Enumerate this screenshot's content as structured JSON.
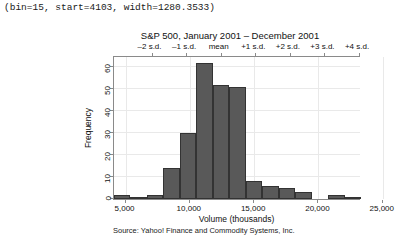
{
  "header": {
    "params_text": "(bin=15, start=4103, width=1280.3533)"
  },
  "source": {
    "text": "Source: Yahoo! Finance and Commodity Systems, Inc."
  },
  "chart_data": {
    "type": "bar",
    "title": "S&P 500, January 2001 – December 2001",
    "xlabel": "Volume (thousands)",
    "ylabel": "Frequency",
    "xlim": [
      4103,
      23308
    ],
    "ylim": [
      0,
      65
    ],
    "grid": true,
    "legend_position": "none",
    "bin_width": 1280.3533,
    "bin_start": 4103,
    "bin_count": 15,
    "categories": [
      "4103–5383",
      "5383–6664",
      "6664–7944",
      "7944–9225",
      "9225–10505",
      "10505–11786",
      "11786–13066",
      "13066–14346",
      "14346–15627",
      "15627–16907",
      "16907–18188",
      "18188–19468",
      "19468–20748",
      "20748–22029",
      "22029–23309"
    ],
    "values": [
      2,
      1,
      2,
      14,
      30,
      62,
      52,
      51,
      8,
      6,
      5,
      3,
      0,
      2,
      1
    ],
    "x_ticks": [
      {
        "value": 5000,
        "label": "5,000"
      },
      {
        "value": 10000,
        "label": "10,000"
      },
      {
        "value": 15000,
        "label": "15,000"
      },
      {
        "value": 20000,
        "label": "20,000"
      },
      {
        "value": 25000,
        "label": "25,000"
      }
    ],
    "y_ticks": [
      {
        "value": 0,
        "label": "0"
      },
      {
        "value": 10,
        "label": "10"
      },
      {
        "value": 20,
        "label": "20"
      },
      {
        "value": 30,
        "label": "30"
      },
      {
        "value": 40,
        "label": "40"
      },
      {
        "value": 50,
        "label": "50"
      },
      {
        "value": 60,
        "label": "60"
      }
    ],
    "top_axis_label": "standard deviation scale",
    "sd_ticks": [
      {
        "label": "–2 s.d.",
        "pos": 0.152
      },
      {
        "label": "–1 s.d.",
        "pos": 0.292
      },
      {
        "label": "mean",
        "pos": 0.432
      },
      {
        "label": "+1 s.d.",
        "pos": 0.572
      },
      {
        "label": "+2 s.d.",
        "pos": 0.712
      },
      {
        "label": "+3 s.d.",
        "pos": 0.852
      },
      {
        "label": "+4 s.d.",
        "pos": 0.992
      }
    ],
    "colors": {
      "bar_fill": "#595959",
      "bar_border": "#333333",
      "axis": "#8a8a8a",
      "grid": "#e9e9e9",
      "text": "#111111",
      "background": "#ffffff"
    }
  }
}
